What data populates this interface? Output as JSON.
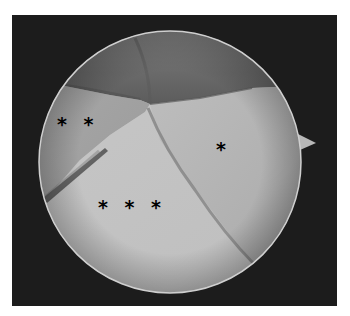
{
  "image": {
    "description": "Arthroscopic view through circular endoscope field with three labeled tissue regions",
    "colors": {
      "frame_background": "#1c1c1c",
      "scope_rim": "#c8c8c8",
      "upper_tissue": "#6e6e6e",
      "right_tissue": "#b4b4b4",
      "lower_tissue": "#c2c2c2",
      "left_tissue": "#a6a6a6",
      "label_color": "#000000"
    }
  },
  "labels": [
    {
      "id": "single",
      "text": "*",
      "x": 217,
      "y": 140
    },
    {
      "id": "double",
      "text": "* *",
      "x": 58,
      "y": 115
    },
    {
      "id": "triple",
      "text": "* * *",
      "x": 99,
      "y": 198
    }
  ]
}
